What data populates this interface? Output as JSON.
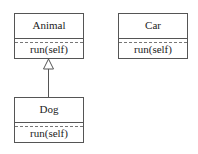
{
  "diagram": {
    "type": "uml-class",
    "classes": [
      {
        "id": "animal",
        "name": "Animal",
        "methods": [
          "run(self)"
        ]
      },
      {
        "id": "car",
        "name": "Car",
        "methods": [
          "run(self)"
        ]
      },
      {
        "id": "dog",
        "name": "Dog",
        "methods": [
          "run(self)"
        ]
      }
    ],
    "relations": [
      {
        "type": "inheritance",
        "from": "Dog",
        "to": "Animal"
      }
    ]
  }
}
